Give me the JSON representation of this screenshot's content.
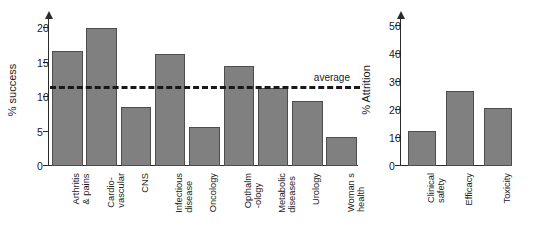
{
  "chart_data": [
    {
      "id": "success",
      "type": "bar",
      "title": "",
      "xlabel": "",
      "ylabel": "% success",
      "ylim": [
        0,
        21.5
      ],
      "yticks": [
        0,
        5,
        10,
        15,
        20
      ],
      "grid": false,
      "legend": "none",
      "bar_color": "#808080",
      "bar_edge_color": "#4d4d4d",
      "categories": [
        "Arthritis\n& pains",
        "Cardio-\nvascular",
        "CNS",
        "Infectious\ndisease",
        "Oncology",
        "Opthalm\n-ology",
        "Metabolic\ndiseases",
        "Urology",
        "Woman s\nhealth"
      ],
      "values": [
        16.7,
        20.0,
        8.6,
        16.3,
        5.6,
        14.5,
        11.3,
        9.5,
        4.2
      ],
      "annotations": [
        {
          "name": "average-line",
          "label": "average",
          "value": 11.2,
          "style": "dashed",
          "color": "#181818"
        }
      ]
    },
    {
      "id": "attrition",
      "type": "bar",
      "title": "",
      "xlabel": "",
      "ylabel": "% Attrition",
      "ylim": [
        0,
        53
      ],
      "yticks": [
        0,
        10,
        20,
        30,
        40,
        50
      ],
      "grid": false,
      "legend": "none",
      "bar_color": "#808080",
      "bar_edge_color": "#4d4d4d",
      "categories": [
        "Clinical\nsafety",
        "Efficacy",
        "Toxicity"
      ],
      "values": [
        12.4,
        27.0,
        20.6
      ],
      "annotations": []
    }
  ]
}
